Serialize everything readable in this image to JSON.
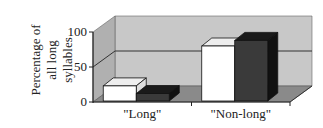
{
  "chart_data": {
    "type": "bar",
    "style": "3d-clustered",
    "title": "",
    "xlabel": "",
    "ylabel": "Percentage of all long syllables",
    "ylabel_lines": [
      "Percentage of",
      "all long",
      "syllables"
    ],
    "ylim": [
      0,
      100
    ],
    "yticks": [
      0,
      50,
      100
    ],
    "grid": true,
    "legend": null,
    "categories": [
      "\"Long\"",
      "\"Non-long\""
    ],
    "series": [
      {
        "name": "white",
        "color": "#ffffff",
        "values": [
          23,
          80
        ]
      },
      {
        "name": "dark",
        "color": "#3a3a3a",
        "values": [
          12,
          88
        ]
      }
    ]
  },
  "colors": {
    "back_wall": "#c8c8c8",
    "side_wall": "#b0b0b0",
    "floor": "#8a8a8a",
    "bar_light": "#ffffff",
    "bar_dark": "#3a3a3a",
    "bar_dark_side": "#111111",
    "axis": "#222222"
  }
}
